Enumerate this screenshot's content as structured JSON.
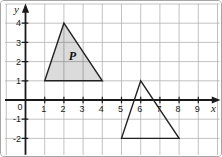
{
  "figure": {
    "type": "coordinate-grid-with-triangles",
    "axis_labels": {
      "x": "x",
      "y": "y"
    },
    "origin_label": "0",
    "x_ticks": [
      "1",
      "2",
      "3",
      "4",
      "5",
      "6",
      "7",
      "8",
      "9"
    ],
    "y_ticks": [
      "-2",
      "-1",
      "1",
      "2",
      "3",
      "4"
    ],
    "x_range_shown": [
      -1,
      10
    ],
    "y_range_shown": [
      -3,
      5
    ],
    "shapes": [
      {
        "id": "triangle-p",
        "label": "P",
        "vertices": [
          [
            1,
            1
          ],
          [
            4,
            1
          ],
          [
            2,
            4
          ]
        ],
        "shaded": true,
        "label_at": [
          2.45,
          2.3
        ]
      },
      {
        "id": "triangle-unlabeled",
        "label": "",
        "vertices": [
          [
            5,
            -2
          ],
          [
            8,
            -2
          ],
          [
            6,
            1
          ]
        ],
        "shaded": false
      }
    ],
    "colors": {
      "background": "#ffffff",
      "border": "#a6a6a6",
      "grid": "#b3b3b3",
      "axis": "#1a1a1a",
      "shape_stroke": "#222222",
      "shape_fill": "rgba(0,0,0,0.14)",
      "text": "#1a1a1a"
    }
  }
}
